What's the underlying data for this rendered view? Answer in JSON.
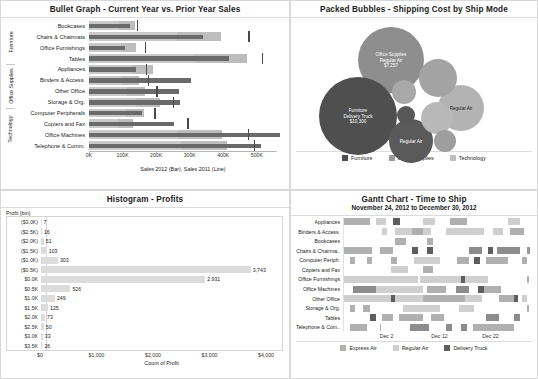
{
  "bullet": {
    "title": "Bullet Graph - Current Year vs. Prior Year Sales",
    "axis_caption": "Sales 2012 (Bar), Sales 2011 (Line)",
    "axis_max": 560000,
    "axis_ticks": [
      {
        "label": "0K",
        "value": 0
      },
      {
        "label": "100K",
        "value": 100000
      },
      {
        "label": "200K",
        "value": 200000
      },
      {
        "label": "300K",
        "value": 300000
      },
      {
        "label": "400K",
        "value": 400000
      },
      {
        "label": "500K",
        "value": 500000
      }
    ],
    "category_groups": [
      {
        "label": "Furniture",
        "count": 4
      },
      {
        "label": "Office Supplies",
        "count": 4
      },
      {
        "label": "Technology",
        "count": 4
      }
    ],
    "rows": [
      {
        "label": "Bookcases",
        "bar": 118000,
        "line": 140000,
        "band_mid": 132000,
        "band_lo": 88000
      },
      {
        "label": "Chairs & Chairmats",
        "bar": 330000,
        "line": 462000,
        "band_mid": 380000,
        "band_lo": 253000
      },
      {
        "label": "Office Furnishings",
        "bar": 104000,
        "line": 163000,
        "band_mid": 137000,
        "band_lo": 91000
      },
      {
        "label": "Tables",
        "bar": 403000,
        "line": 500000,
        "band_mid": 455000,
        "band_lo": 303000
      },
      {
        "label": "Appliances",
        "bar": 136000,
        "line": 166000,
        "band_mid": 185000,
        "band_lo": 123000
      },
      {
        "label": "Binders & Access.",
        "bar": 294000,
        "line": 172000,
        "band_mid": 143000,
        "band_lo": 95000
      },
      {
        "label": "Other Office",
        "bar": 259000,
        "line": 196000,
        "band_mid": 163000,
        "band_lo": 109000
      },
      {
        "label": "Storage & Org.",
        "bar": 264000,
        "line": 244000,
        "band_mid": 204000,
        "band_lo": 136000
      },
      {
        "label": "Computer Peripherals",
        "bar": 152000,
        "line": 190000,
        "band_mid": 158000,
        "band_lo": 105000
      },
      {
        "label": "Copiers and Fax",
        "bar": 244000,
        "line": 286000,
        "band_mid": 128000,
        "band_lo": 85000
      },
      {
        "label": "Office Machines",
        "bar": 552000,
        "line": 461000,
        "band_mid": 384000,
        "band_lo": 256000
      },
      {
        "label": "Telephone & Comm.",
        "bar": 497000,
        "line": 478000,
        "band_mid": 398000,
        "band_lo": 265000
      }
    ]
  },
  "bubbles": {
    "title": "Packed Bubbles - Shipping Cost by Ship Mode",
    "legend": [
      {
        "label": "Furniture",
        "color": "#4d4d4d"
      },
      {
        "label": "Office Supplies",
        "color": "#9a9a9a"
      },
      {
        "label": "Technology",
        "color": "#bfbfbf"
      }
    ],
    "items": [
      {
        "name": "Office Supplies Regular Air",
        "category": "Office Supplies",
        "ship_mode": "Regular Air",
        "value": "$7,257",
        "label": "Office Supplies\nRegular Air\n$7,257",
        "color": "#8e8e8e",
        "cx": 100,
        "cy": 42,
        "r": 33,
        "labeled": true,
        "light": false
      },
      {
        "name": "Furniture Delivery Truck",
        "category": "Furniture",
        "ship_mode": "Delivery Truck",
        "value": "$10,300",
        "label": "Furniture\nDelivery Truck\n$10,300",
        "color": "#4f4f4f",
        "cx": 67,
        "cy": 98,
        "r": 39,
        "labeled": true,
        "light": false
      },
      {
        "name": "Technology Regular Air",
        "category": "Technology",
        "ship_mode": "Regular Air",
        "value": "",
        "label": "Regular Air",
        "color": "#b3b3b3",
        "cx": 170,
        "cy": 90,
        "r": 23,
        "labeled": true,
        "light": true
      },
      {
        "name": "Furniture Regular Air",
        "category": "Furniture",
        "ship_mode": "Regular Air",
        "value": "",
        "label": "Regular Air",
        "color": "#5a5a5a",
        "cx": 120,
        "cy": 123,
        "r": 22,
        "labeled": true,
        "light": false
      },
      {
        "name": "Office Supplies Delivery Truck",
        "category": "Office Supplies",
        "ship_mode": "Delivery Truck",
        "value": "",
        "label": "",
        "color": "#a3a3a3",
        "cx": 147,
        "cy": 60,
        "r": 19,
        "labeled": false,
        "light": false
      },
      {
        "name": "Technology Express Air",
        "category": "Technology",
        "ship_mode": "Express Air",
        "value": "",
        "label": "",
        "color": "#b8b8b8",
        "cx": 146,
        "cy": 100,
        "r": 16,
        "labeled": false,
        "light": false
      },
      {
        "name": "Office Supplies Express Air",
        "category": "Office Supplies",
        "ship_mode": "Express Air",
        "value": "",
        "label": "",
        "color": "#a8a8a8",
        "cx": 113,
        "cy": 74,
        "r": 12,
        "labeled": false,
        "light": false
      },
      {
        "name": "Technology Delivery Truck",
        "category": "Technology",
        "ship_mode": "Delivery Truck",
        "value": "",
        "label": "",
        "color": "#585858",
        "cx": 115,
        "cy": 97,
        "r": 9,
        "labeled": false,
        "light": false
      },
      {
        "name": "Furniture Express Air",
        "category": "Furniture",
        "ship_mode": "Express Air",
        "value": "",
        "label": "",
        "color": "#9e9e9e",
        "cx": 154,
        "cy": 123,
        "r": 11,
        "labeled": false,
        "light": false
      }
    ]
  },
  "histogram": {
    "title": "Histogram - Profits",
    "y_header": "Profit (bin)",
    "x_caption": "Count of Profit",
    "x_max": 4300,
    "x_ticks": [
      {
        "label": "$0",
        "value": 0
      },
      {
        "label": "$1,000",
        "value": 1000
      },
      {
        "label": "$2,000",
        "value": 2000
      },
      {
        "label": "$3,000",
        "value": 3000
      },
      {
        "label": "$4,000",
        "value": 4000
      }
    ],
    "bins": [
      {
        "label": "($3.0K)",
        "value": 7,
        "display": "7"
      },
      {
        "label": "($2.5K)",
        "value": 16,
        "display": "16"
      },
      {
        "label": "($2.0K)",
        "value": 51,
        "display": "51"
      },
      {
        "label": "($1.5K)",
        "value": 103,
        "display": "103"
      },
      {
        "label": "($1.0K)",
        "value": 303,
        "display": "303"
      },
      {
        "label": "($0.5K)",
        "value": 3743,
        "display": "3,743"
      },
      {
        "label": "$0.0K",
        "value": 2931,
        "display": "2,931"
      },
      {
        "label": "$0.5K",
        "value": 526,
        "display": "526"
      },
      {
        "label": "$1.0K",
        "value": 249,
        "display": "249"
      },
      {
        "label": "$1.5K",
        "value": 125,
        "display": "125"
      },
      {
        "label": "$2.0K",
        "value": 73,
        "display": "73"
      },
      {
        "label": "$2.5K",
        "value": 50,
        "display": "50"
      },
      {
        "label": "$3.0K",
        "value": 33,
        "display": "33"
      },
      {
        "label": "$3.5K",
        "value": 26,
        "display": "26"
      }
    ]
  },
  "gantt": {
    "title": "Gantt Chart - Time to Ship",
    "subtitle": "November 24, 2012 to December 30, 2012",
    "legend": [
      {
        "label": "Express Air",
        "color": "#b0b0b0"
      },
      {
        "label": "Regular Air",
        "color": "#cfcfcf"
      },
      {
        "label": "Delivery Truck",
        "color": "#5e5e5e"
      }
    ],
    "x_ticks": [
      {
        "label": "Dec 2",
        "pos": 22.5
      },
      {
        "label": "Dec 12",
        "pos": 50.5
      },
      {
        "label": "Dec 22",
        "pos": 77.5
      }
    ],
    "rows": [
      {
        "label": "Appliances",
        "segments": [
          {
            "start": 0,
            "width": 14,
            "color": "#b0b0b0"
          },
          {
            "start": 17,
            "width": 5,
            "color": "#cfcfcf"
          },
          {
            "start": 26,
            "width": 3.5,
            "color": "#5e5e5e"
          },
          {
            "start": 42,
            "width": 6,
            "color": "#cfcfcf"
          },
          {
            "start": 56,
            "width": 9,
            "color": "#b0b0b0"
          },
          {
            "start": 87,
            "width": 6,
            "color": "#cfcfcf"
          }
        ]
      },
      {
        "label": "Binders & Access.",
        "segments": [
          {
            "start": 20,
            "width": 3,
            "color": "#cfcfcf"
          },
          {
            "start": 27,
            "width": 19,
            "color": "#cfcfcf"
          },
          {
            "start": 36,
            "width": 6,
            "color": "#b0b0b0"
          },
          {
            "start": 54,
            "width": 20,
            "color": "#cfcfcf"
          },
          {
            "start": 79,
            "width": 5,
            "color": "#cfcfcf"
          },
          {
            "start": 88,
            "width": 7,
            "color": "#b0b0b0"
          }
        ]
      },
      {
        "label": "Bookcases",
        "segments": [
          {
            "start": 27,
            "width": 6,
            "color": "#b0b0b0"
          },
          {
            "start": 44,
            "width": 3,
            "color": "#b0b0b0"
          }
        ]
      },
      {
        "label": "Chairs & Chairma..",
        "segments": [
          {
            "start": 0,
            "width": 15,
            "color": "#b0b0b0"
          },
          {
            "start": 19,
            "width": 7,
            "color": "#b0b0b0"
          },
          {
            "start": 36,
            "width": 3,
            "color": "#5e5e5e"
          },
          {
            "start": 44,
            "width": 3,
            "color": "#5e5e5e"
          },
          {
            "start": 66,
            "width": 7,
            "color": "#8c8c8c"
          },
          {
            "start": 76,
            "width": 3,
            "color": "#5e5e5e"
          },
          {
            "start": 81,
            "width": 12,
            "color": "#8c8c8c"
          },
          {
            "start": 97,
            "width": 1.2,
            "color": "#9a9a9a"
          }
        ]
      },
      {
        "label": "Computer Periph.",
        "segments": [
          {
            "start": 3,
            "width": 3,
            "color": "#b0b0b0"
          },
          {
            "start": 12,
            "width": 3,
            "color": "#b0b0b0"
          },
          {
            "start": 25,
            "width": 3,
            "color": "#b0b0b0"
          },
          {
            "start": 37,
            "width": 14,
            "color": "#cfcfcf"
          },
          {
            "start": 60,
            "width": 6,
            "color": "#b0b0b0"
          },
          {
            "start": 69,
            "width": 3,
            "color": "#5e5e5e"
          },
          {
            "start": 75,
            "width": 12,
            "color": "#b0b0b0"
          },
          {
            "start": 94,
            "width": 3,
            "color": "#b0b0b0"
          }
        ]
      },
      {
        "label": "Copiers and Fax",
        "segments": [
          {
            "start": 25,
            "width": 9,
            "color": "#cfcfcf"
          },
          {
            "start": 42,
            "width": 5,
            "color": "#b0b0b0"
          }
        ]
      },
      {
        "label": "Office Furnishings",
        "segments": [
          {
            "start": 0,
            "width": 39,
            "color": "#cfcfcf"
          },
          {
            "start": 40,
            "width": 27,
            "color": "#cfcfcf"
          },
          {
            "start": 62,
            "width": 2,
            "color": "#5e5e5e"
          },
          {
            "start": 67,
            "width": 9,
            "color": "#cfcfcf"
          },
          {
            "start": 97,
            "width": 1,
            "color": "#b0b0b0"
          }
        ]
      },
      {
        "label": "Office Machines",
        "segments": [
          {
            "start": 5,
            "width": 12,
            "color": "#8c8c8c"
          },
          {
            "start": 17,
            "width": 25,
            "color": "#cfcfcf"
          },
          {
            "start": 44,
            "width": 10,
            "color": "#b0b0b0"
          },
          {
            "start": 59,
            "width": 7,
            "color": "#8c8c8c"
          },
          {
            "start": 71,
            "width": 5,
            "color": "#5e5e5e"
          },
          {
            "start": 74,
            "width": 9,
            "color": "#b0b0b0"
          }
        ]
      },
      {
        "label": "Other Office",
        "segments": [
          {
            "start": 0,
            "width": 25,
            "color": "#cfcfcf"
          },
          {
            "start": 25,
            "width": 2,
            "color": "#5e5e5e"
          },
          {
            "start": 27,
            "width": 15,
            "color": "#cfcfcf"
          },
          {
            "start": 42,
            "width": 22,
            "color": "#b0b0b0"
          },
          {
            "start": 64,
            "width": 9,
            "color": "#cfcfcf"
          },
          {
            "start": 82,
            "width": 8,
            "color": "#b0b0b0"
          },
          {
            "start": 90,
            "width": 2,
            "color": "#5e5e5e"
          },
          {
            "start": 94,
            "width": 3,
            "color": "#cfcfcf"
          }
        ]
      },
      {
        "label": "Storage & Org.",
        "segments": [
          {
            "start": 3,
            "width": 3,
            "color": "#b0b0b0"
          },
          {
            "start": 10,
            "width": 4,
            "color": "#b0b0b0"
          },
          {
            "start": 31,
            "width": 20,
            "color": "#cfcfcf"
          },
          {
            "start": 61,
            "width": 8,
            "color": "#cfcfcf"
          },
          {
            "start": 97,
            "width": 1,
            "color": "#b0b0b0"
          }
        ]
      },
      {
        "label": "Tables",
        "segments": [
          {
            "start": 14,
            "width": 3,
            "color": "#5e5e5e"
          },
          {
            "start": 20,
            "width": 6,
            "color": "#b0b0b0"
          },
          {
            "start": 29,
            "width": 13,
            "color": "#b0b0b0"
          },
          {
            "start": 46,
            "width": 7,
            "color": "#b0b0b0"
          },
          {
            "start": 75,
            "width": 7,
            "color": "#8c8c8c"
          },
          {
            "start": 90,
            "width": 3,
            "color": "#8c8c8c"
          }
        ]
      },
      {
        "label": "Telephone & Com..",
        "segments": [
          {
            "start": 3,
            "width": 9,
            "color": "#b0b0b0"
          },
          {
            "start": 19,
            "width": 0.8,
            "color": "#b0b0b0"
          },
          {
            "start": 35,
            "width": 10,
            "color": "#8c8c8c"
          },
          {
            "start": 54,
            "width": 3,
            "color": "#8c8c8c"
          },
          {
            "start": 62,
            "width": 3,
            "color": "#8c8c8c"
          },
          {
            "start": 68,
            "width": 22,
            "color": "#b0b0b0"
          }
        ]
      }
    ]
  }
}
